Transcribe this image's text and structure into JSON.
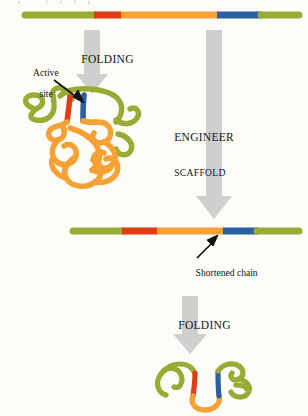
{
  "figure": {
    "domain": "scientific-diagram",
    "background_color": "#fdfcf7"
  },
  "palette": {
    "scaffold_green": "#9aab35",
    "segment_red": "#e03c16",
    "loop_orange": "#f5a134",
    "active_site_blue": "#2b5fa0",
    "arrow_gray": "#cfcfcf",
    "arrow_gray_dark": "#bdbdbd",
    "pointer_black": "#111111",
    "text_color": "#141414"
  },
  "labels": {
    "folding_top": "FOLDING",
    "folding_bottom": "FOLDING",
    "engineer_line1": "ENGINEER",
    "engineer_line2": "SCAFFOLD",
    "active_site_line1": "Active",
    "active_site_line2": "site",
    "shortened_chain": "Shortened chain"
  },
  "chains": {
    "full_length": {
      "name": "full-length linear chain",
      "y": 15,
      "x_start": 22,
      "x_end": 300,
      "segments": [
        {
          "name": "green-n-terminal",
          "color": "#9aab35",
          "x1": 22,
          "x2": 95
        },
        {
          "name": "red-segment",
          "color": "#e03c16",
          "x1": 95,
          "x2": 122
        },
        {
          "name": "orange-segment",
          "color": "#f5a134",
          "x1": 122,
          "x2": 218
        },
        {
          "name": "blue-active-site",
          "color": "#2b5fa0",
          "x1": 218,
          "x2": 262
        },
        {
          "name": "green-c-terminal",
          "color": "#9aab35",
          "x1": 262,
          "x2": 300
        }
      ]
    },
    "shortened": {
      "name": "shortened linear chain",
      "y": 231,
      "x_start": 70,
      "x_end": 300,
      "segments": [
        {
          "name": "green-n-terminal",
          "color": "#9aab35",
          "x1": 70,
          "x2": 123
        },
        {
          "name": "red-segment",
          "color": "#e03c16",
          "x1": 123,
          "x2": 158
        },
        {
          "name": "orange-segment",
          "color": "#f5a134",
          "x1": 158,
          "x2": 224
        },
        {
          "name": "blue-active-site",
          "color": "#2b5fa0",
          "x1": 224,
          "x2": 258
        },
        {
          "name": "green-c-terminal",
          "color": "#9aab35",
          "x1": 258,
          "x2": 300
        }
      ]
    }
  },
  "folded_structures": {
    "large_protein": {
      "name": "folded full-length protein with large orange scaffold tangle",
      "center": [
        76,
        140
      ],
      "has_active_site": true,
      "active_site_color": "#2b5fa0",
      "red_segment_color": "#e03c16"
    },
    "small_protein": {
      "name": "folded engineered protein, compact",
      "center": [
        210,
        382
      ],
      "has_active_site": true,
      "active_site_color": "#2b5fa0",
      "red_segment_color": "#e03c16"
    }
  },
  "arrows": {
    "folding_top": {
      "name": "gray down arrow (folding, top)",
      "x": 92,
      "y_top": 30,
      "y_bottom": 92
    },
    "engineer": {
      "name": "long gray down arrow (engineer scaffold)",
      "x": 214,
      "y_top": 30,
      "y_bottom": 218
    },
    "folding_bottom": {
      "name": "gray down arrow (folding, bottom)",
      "x": 190,
      "y_top": 296,
      "y_bottom": 352
    },
    "active_site_pointer": {
      "name": "black pointer to active site",
      "from": [
        52,
        78
      ],
      "to": [
        82,
        100
      ]
    },
    "shortened_pointer": {
      "name": "black pointer to shortened chain",
      "from": [
        196,
        258
      ],
      "to": [
        216,
        236
      ]
    }
  }
}
